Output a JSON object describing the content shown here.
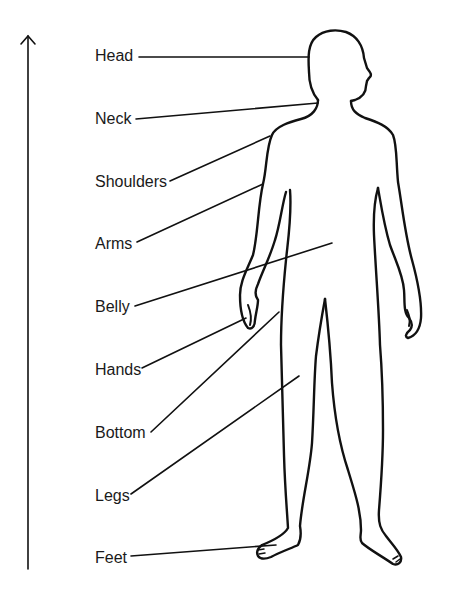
{
  "diagram": {
    "title": "",
    "type": "labelled-body-outline",
    "line_color": "#111111",
    "background": "#ffffff",
    "vertical_arrow": {
      "direction": "up",
      "x": 28,
      "y_top": 35,
      "y_bottom": 569
    },
    "labels": [
      {
        "text": "Head",
        "x": 95,
        "y": 47,
        "leader_from": [
          138,
          57
        ],
        "leader_to": [
          308,
          57
        ]
      },
      {
        "text": "Neck",
        "x": 95,
        "y": 110,
        "leader_from": [
          135,
          119
        ],
        "leader_to": [
          318,
          103
        ]
      },
      {
        "text": "Shoulders",
        "x": 95,
        "y": 173,
        "leader_from": [
          169,
          181
        ],
        "leader_to": [
          270,
          136
        ]
      },
      {
        "text": "Arms",
        "x": 95,
        "y": 235,
        "leader_from": [
          136,
          242
        ],
        "leader_to": [
          263,
          184
        ]
      },
      {
        "text": "Belly",
        "x": 95,
        "y": 298,
        "leader_from": [
          134,
          306
        ],
        "leader_to": [
          333,
          243
        ]
      },
      {
        "text": "Hands",
        "x": 95,
        "y": 361,
        "leader_from": [
          141,
          368
        ],
        "leader_to": [
          246,
          318
        ]
      },
      {
        "text": "Bottom",
        "x": 95,
        "y": 424,
        "leader_from": [
          150,
          432
        ],
        "leader_to": [
          279,
          312
        ]
      },
      {
        "text": "Legs",
        "x": 95,
        "y": 487,
        "leader_from": [
          130,
          494
        ],
        "leader_to": [
          300,
          376
        ]
      },
      {
        "text": "Feet",
        "x": 95,
        "y": 549,
        "leader_from": [
          130,
          556
        ],
        "leader_to": [
          276,
          545
        ]
      }
    ]
  }
}
